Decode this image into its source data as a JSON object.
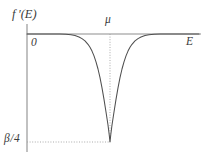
{
  "figure": {
    "title": "",
    "background_color": "#ffffff",
    "line_color": "#4a4a4a",
    "axis_color": "#888888",
    "guide_color": "#9a9a9a",
    "width": 209,
    "height": 164
  },
  "labels": {
    "yaxis": "f ′(E)",
    "origin": "0",
    "mu": "μ",
    "xaxis": "E",
    "ymin": "β 4"
  },
  "chart_data": {
    "type": "line",
    "title": "",
    "xlabel": "E",
    "ylabel": "f'(E)",
    "xlim": [
      0,
      1
    ],
    "ylim": [
      -0.25,
      0.02
    ],
    "grid": false,
    "legend_position": "none",
    "annotations": [
      {
        "name": "mu-tick",
        "text": "μ",
        "x": 0.5,
        "y": 0.0
      },
      {
        "name": "origin",
        "text": "0",
        "x": 0.0,
        "y": 0.0
      },
      {
        "name": "minimum-value",
        "text": "β/4",
        "x": 0.0,
        "y": -0.25
      }
    ],
    "guides": [
      {
        "name": "mu-vertical-dotted",
        "orientation": "vertical",
        "value": 0.5,
        "style": "dotted"
      },
      {
        "name": "beta4-horizontal-dotted",
        "orientation": "horizontal",
        "value": -0.25,
        "style": "dotted"
      }
    ],
    "series": [
      {
        "name": "f'(E)",
        "description": "derivative of Fermi-Dirac distribution, negative sech-squared peak centred at mu with minimum -beta/4",
        "x": [
          0.0,
          0.05,
          0.1,
          0.15,
          0.2,
          0.24,
          0.28,
          0.32,
          0.35,
          0.38,
          0.4,
          0.42,
          0.44,
          0.46,
          0.48,
          0.5,
          0.52,
          0.54,
          0.56,
          0.58,
          0.6,
          0.62,
          0.65,
          0.68,
          0.72,
          0.76,
          0.8,
          0.85,
          0.9,
          0.95,
          1.0
        ],
        "y": [
          0.0,
          0.0,
          0.0,
          0.0,
          -0.001,
          -0.002,
          -0.005,
          -0.012,
          -0.022,
          -0.04,
          -0.056,
          -0.078,
          -0.106,
          -0.14,
          -0.185,
          -0.25,
          -0.185,
          -0.14,
          -0.106,
          -0.078,
          -0.056,
          -0.04,
          -0.019,
          -0.01,
          -0.004,
          -0.002,
          -0.001,
          0.0,
          0.0,
          0.0,
          0.0
        ]
      }
    ]
  }
}
